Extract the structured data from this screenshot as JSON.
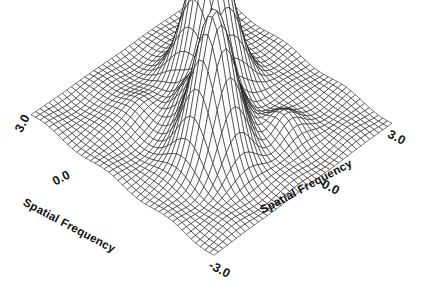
{
  "figure": {
    "background_color": "#ffffff",
    "ink_color": "#111111",
    "kind": "3d-wireframe-surface"
  },
  "axes": {
    "left": {
      "title": "Spatial Frequency",
      "ticks": [
        "3.0",
        "0.0"
      ]
    },
    "right": {
      "title": "Spatial Frequency",
      "ticks": [
        "3.0",
        "0.0",
        "-3.0"
      ]
    }
  },
  "chart_data": {
    "type": "surface",
    "title": "",
    "subtitle": "",
    "xlabel": "Spatial Frequency",
    "ylabel": "Spatial Frequency",
    "zlabel": "",
    "xlim": [
      -3.0,
      3.0
    ],
    "ylim": [
      -3.0,
      3.0
    ],
    "zlim": [
      0.0,
      1.0
    ],
    "xticks": [
      -3.0,
      0.0,
      3.0
    ],
    "yticks": [
      -3.0,
      0.0,
      3.0
    ],
    "xticklabels": [
      "-3.0",
      "0.0",
      "3.0"
    ],
    "yticklabels": [
      "-3.0",
      "0.0",
      "3.0"
    ],
    "grid": false,
    "legend": false,
    "legend_position": "none",
    "mesh": {
      "nx": 41,
      "ny": 41,
      "wireframe": true,
      "hidden_line_removal": true
    },
    "view": {
      "elevation_deg": 28,
      "azimuth_deg": 45,
      "projection": "oblique"
    },
    "peaks": [
      {
        "name": "lobe-left",
        "x": -0.85,
        "y": 0.8,
        "height": 1.0,
        "sigma": 0.52
      },
      {
        "name": "lobe-right",
        "x": 0.85,
        "y": -0.8,
        "height": 0.98,
        "sigma": 0.5
      },
      {
        "name": "bump-a",
        "x": 0.35,
        "y": 0.1,
        "height": 0.3,
        "sigma": 0.38
      },
      {
        "name": "bump-b",
        "x": -0.25,
        "y": -0.45,
        "height": 0.22,
        "sigma": 0.36
      },
      {
        "name": "bump-c",
        "x": 1.45,
        "y": 0.95,
        "height": 0.12,
        "sigma": 0.4
      },
      {
        "name": "bump-d",
        "x": -1.35,
        "y": -1.05,
        "height": 0.1,
        "sigma": 0.42
      }
    ],
    "baseline": {
      "level": 0.02,
      "ripple_amplitude": 0.015
    }
  }
}
